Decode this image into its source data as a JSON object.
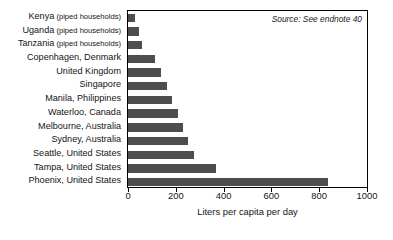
{
  "chart_data": {
    "type": "bar",
    "orientation": "horizontal",
    "title": "",
    "xlabel": "Liters per capita per day",
    "ylabel": "",
    "xlim": [
      0,
      1000
    ],
    "xticks": [
      0,
      200,
      400,
      600,
      800,
      1000
    ],
    "xtick_labels": [
      "0",
      "200",
      "400",
      "600",
      "800",
      "1000"
    ],
    "grid": false,
    "legend": null,
    "annotations": [
      "Source: See endnote 40"
    ],
    "bar_color": "#4d4d4d",
    "categories": [
      "Kenya (piped households)",
      "Uganda (piped households)",
      "Tanzania (piped households)",
      "Copenhagen, Denmark",
      "United Kingdom",
      "Singapore",
      "Manila, Philippines",
      "Waterloo, Canada",
      "Melbourne, Australia",
      "Sydney, Australia",
      "Seattle, United States",
      "Tampa, United States",
      "Phoenix, United States"
    ],
    "values": [
      30,
      45,
      60,
      115,
      140,
      165,
      185,
      210,
      230,
      250,
      275,
      370,
      835
    ]
  },
  "categories_display": [
    {
      "name": "Kenya",
      "qualifier": " (piped households)"
    },
    {
      "name": "Uganda",
      "qualifier": " (piped households)"
    },
    {
      "name": "Tanzania",
      "qualifier": " (piped households)"
    },
    {
      "name": "Copenhagen, Denmark",
      "qualifier": ""
    },
    {
      "name": "United Kingdom",
      "qualifier": ""
    },
    {
      "name": "Singapore",
      "qualifier": ""
    },
    {
      "name": "Manila, Philippines",
      "qualifier": ""
    },
    {
      "name": "Waterloo, Canada",
      "qualifier": ""
    },
    {
      "name": "Melbourne, Australia",
      "qualifier": ""
    },
    {
      "name": "Sydney, Australia",
      "qualifier": ""
    },
    {
      "name": "Seattle, United States",
      "qualifier": ""
    },
    {
      "name": "Tampa, United States",
      "qualifier": ""
    },
    {
      "name": "Phoenix, United States",
      "qualifier": ""
    }
  ],
  "source_note": "Source: See endnote 40"
}
